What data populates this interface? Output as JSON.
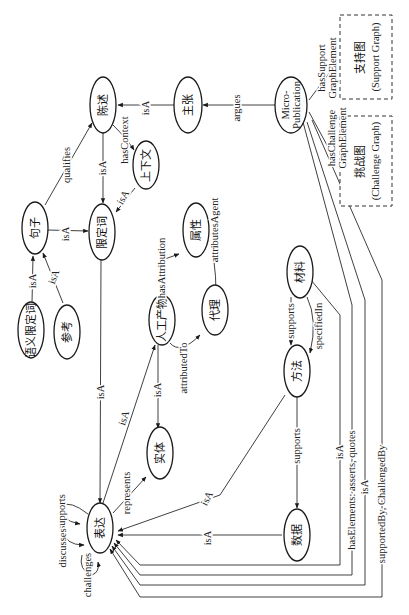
{
  "diagram": {
    "orientation": "rotated-90-ccw",
    "nodes": {
      "statement": "陈述",
      "claim": "主张",
      "micropub_line1": "Micro-",
      "micropub_line2": "Publication",
      "context": "上下文",
      "sentence": "句子",
      "qualifier": "限定词",
      "semantic_qualifier": "语义限定词",
      "reference": "参考",
      "artifact": "人工产物",
      "attribute": "属性",
      "agent": "代理",
      "material": "材料",
      "method": "方法",
      "entity": "实体",
      "representation": "表达",
      "data": "数据"
    },
    "boxes": {
      "support_graph_cn": "支持图",
      "support_graph_en": "(Support Graph)",
      "challenge_graph_cn": "挑战图",
      "challenge_graph_en": "(Challenge Graph)"
    },
    "edges": {
      "argues": "argues",
      "claim_isA": "isA",
      "hasContext": "hasContext",
      "qualifies": "qualifies",
      "statement_isA": "isA",
      "context_isA": "isA",
      "sentence_isA": "isA",
      "semq_isA": "isA",
      "ref_isA": "isA",
      "hasAttribution": "hasAttribution",
      "attributesAgent": "attributesAgent",
      "attributedTo": "attributedTo",
      "qualifier_isA": "isA",
      "artifact_isA_rep": "isA",
      "artifact_isA_entity": "isA",
      "represents": "represents",
      "supports_material": "supports",
      "specifiedIn": "specifiedIn",
      "supports_method": "supports",
      "method_isA": "isA",
      "data_isA": "isA",
      "material_isA": "isA",
      "hasElements": "hasElements: asserts, quotes",
      "micropub_isA": "isA",
      "supportedBy": "supportedBy, ChallengedBy",
      "hasSupport_1": "hasSupport",
      "hasSupport_2": "GraphElement",
      "hasChallenge_1": "hasChallenge",
      "hasChallenge_2": "GraphElement",
      "self_supports": "supports",
      "self_discusses": "discusses",
      "self_challenges": "challenges"
    }
  }
}
